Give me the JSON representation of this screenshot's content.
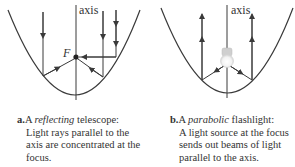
{
  "panel_a": {
    "axis_label": "axis",
    "focus_label": "F",
    "caption": {
      "letter": "a.",
      "prefix": "A ",
      "emphasis": "reflecting",
      "suffix": " telescope:",
      "body": "Light rays parallel to the axis are concentrated at the focus."
    }
  },
  "panel_b": {
    "axis_label": "axis",
    "caption": {
      "letter": "b.",
      "prefix": "A ",
      "emphasis": "parabolic",
      "suffix": " flashlight:",
      "body": "A light source at the focus sends out beams of light parallel to the axis."
    }
  },
  "colors": {
    "line": "#3a3a3a",
    "text": "#333333"
  }
}
